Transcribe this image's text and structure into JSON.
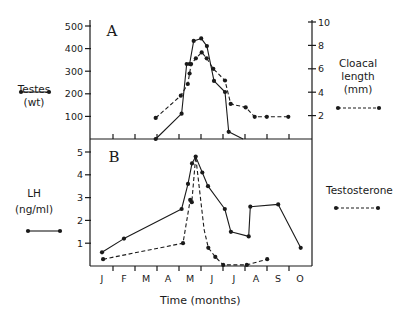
{
  "chart_data": [
    {
      "type": "line",
      "panel": "A",
      "title": "A",
      "xlabel": "",
      "x_unit": "month (1 = Jan mid-month tick label position)",
      "categories": [
        "J",
        "F",
        "M",
        "A",
        "M",
        "J",
        "J",
        "A",
        "S",
        "O"
      ],
      "y_left": {
        "label": "Testes (wt)",
        "ticks": [
          100,
          200,
          300,
          400,
          500
        ],
        "ylim": [
          0,
          500
        ]
      },
      "y_right": {
        "label": "Cloacal length (mm)",
        "ticks": [
          2,
          4,
          6,
          8,
          10
        ],
        "ylim": [
          0,
          10
        ]
      },
      "series": [
        {
          "name": "Testes (wt)",
          "axis": "left",
          "style": "solid",
          "points": [
            [
              3.44,
              0
            ],
            [
              4.62,
              112
            ],
            [
              4.85,
              332
            ],
            [
              4.98,
              332
            ],
            [
              5.17,
              434
            ],
            [
              5.51,
              445
            ],
            [
              5.77,
              411
            ],
            [
              6.09,
              257
            ],
            [
              6.59,
              208
            ],
            [
              6.76,
              32
            ],
            [
              7.41,
              0
            ]
          ],
          "marker_last": false
        },
        {
          "name": "Cloacal length (mm)",
          "axis": "right",
          "style": "dashed",
          "points": [
            [
              3.44,
              1.8
            ],
            [
              4.58,
              3.7
            ],
            [
              4.9,
              4.7
            ],
            [
              4.98,
              5.6
            ],
            [
              5.05,
              6.4
            ],
            [
              5.27,
              6.9
            ],
            [
              5.53,
              7.4
            ],
            [
              5.76,
              6.9
            ],
            [
              6.06,
              6.0
            ],
            [
              6.59,
              5.0
            ],
            [
              6.85,
              3.0
            ],
            [
              7.53,
              2.7
            ],
            [
              7.94,
              1.9
            ],
            [
              8.49,
              1.9
            ],
            [
              9.47,
              1.9
            ]
          ]
        }
      ],
      "grid": false,
      "legend_position": "outside left / right"
    },
    {
      "type": "line",
      "panel": "B",
      "title": "B",
      "xlabel": "Time (months)",
      "categories": [
        "J",
        "F",
        "M",
        "A",
        "M",
        "J",
        "J",
        "A",
        "S",
        "O"
      ],
      "y_left": {
        "label": "LH (ng/ml)",
        "ticks": [
          1,
          2,
          3,
          4,
          5
        ],
        "ylim": [
          0,
          5.5
        ]
      },
      "series": [
        {
          "name": "LH (ng/ml)",
          "style": "solid",
          "points": [
            [
              1.0,
              0.6
            ],
            [
              2.0,
              1.2
            ],
            [
              4.62,
              2.5
            ],
            [
              4.91,
              3.6
            ],
            [
              5.09,
              4.5
            ],
            [
              5.26,
              4.8
            ],
            [
              5.56,
              4.1
            ],
            [
              5.82,
              3.5
            ],
            [
              6.58,
              2.5
            ],
            [
              6.86,
              1.5
            ],
            [
              7.67,
              1.3
            ],
            [
              7.74,
              2.6
            ],
            [
              9.01,
              2.7
            ],
            [
              10.03,
              0.8
            ]
          ]
        },
        {
          "name": "Testosterone",
          "style": "dashed",
          "points": [
            [
              1.05,
              0.3
            ],
            [
              4.68,
              1.0
            ],
            [
              5.01,
              2.9
            ],
            [
              5.08,
              2.8
            ],
            [
              5.26,
              4.8
            ],
            [
              5.64,
              1.6
            ],
            [
              5.83,
              0.8
            ],
            [
              6.15,
              0.4
            ],
            [
              6.51,
              0.05
            ],
            [
              7.58,
              0.05
            ],
            [
              8.51,
              0.3
            ]
          ],
          "markers_skip": [
            4,
            5
          ]
        }
      ],
      "grid": false,
      "legend_position": "outside left / right"
    }
  ],
  "labels": {
    "panel_a": "A",
    "panel_b": "B",
    "testes_line1": "Testes",
    "testes_line2": "(wt)",
    "cloacal_line1": "Cloacal",
    "cloacal_line2": "length",
    "cloacal_line3": "(mm)",
    "lh_line1": "LH",
    "lh_line2": "(ng/ml)",
    "testosterone": "Testosterone",
    "xlabel": "Time (months)"
  },
  "colors": {
    "ink": "#1a1a1a",
    "background": "#ffffff"
  }
}
